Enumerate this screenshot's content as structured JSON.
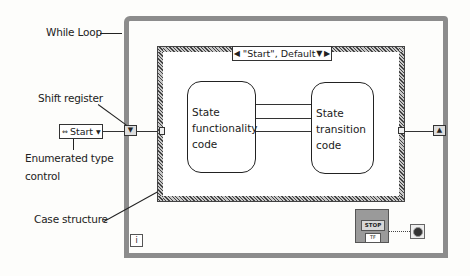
{
  "labels": {
    "while_loop": "While Loop",
    "shift_register": "Shift register",
    "enum_line1": "Enumerated type",
    "enum_line2": "control",
    "case_structure": "Case structure"
  },
  "case_selector": {
    "value": "\"Start\", Default",
    "left_arrow": "◀",
    "dropdown": "▼",
    "right_arrow": "▶"
  },
  "state_boxes": {
    "functionality": [
      "State",
      "functionality",
      "code"
    ],
    "transition": [
      "State",
      "transition",
      "code"
    ]
  },
  "enum_control": {
    "value": "Start",
    "spin_glyph": "⇔",
    "dropdown": "▼"
  },
  "shift_register": {
    "left_glyph": "▼",
    "right_glyph": "▲"
  },
  "iteration_terminal": {
    "glyph": "i"
  },
  "stop_terminal": {
    "button": "STOP",
    "tf": "TF"
  },
  "colors": {
    "loop_border": "#8c8c8c",
    "case_border": "#555555",
    "wire": "#333333",
    "background": "#fdfdfb"
  }
}
